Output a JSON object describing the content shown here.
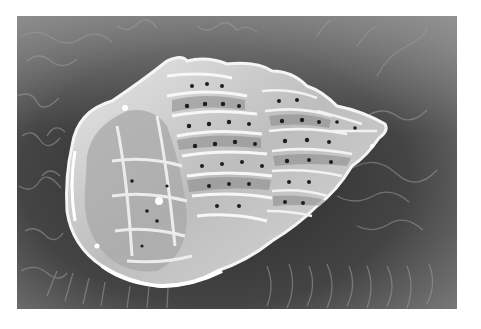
{
  "image": {
    "kind": "scanning electron micrograph",
    "subject": "microfossil specimen (multi-chambered, perforated test) on wrinkled substrate",
    "tone": "grayscale",
    "colors": {
      "page_background": "#ffffff",
      "substrate_dark": "#2e2e2e",
      "substrate_mid": "#5a5a5a",
      "substrate_light": "#8c8c8c",
      "specimen_highlight": "#f2f2f2",
      "specimen_mid": "#b8b8b8",
      "specimen_shadow": "#6e6e6e",
      "pore": "#1e1e1e"
    }
  }
}
